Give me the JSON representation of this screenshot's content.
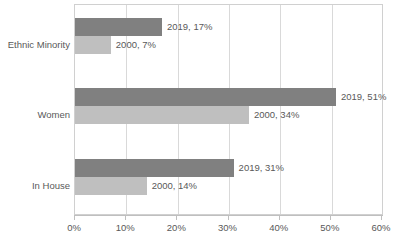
{
  "chart_data": {
    "type": "bar",
    "orientation": "horizontal",
    "title": "",
    "subtitle": "",
    "xlabel": "",
    "ylabel": "",
    "xlim": [
      0,
      60
    ],
    "xticks": [
      "0%",
      "10%",
      "20%",
      "30%",
      "40%",
      "50%",
      "60%"
    ],
    "xtick_values": [
      0,
      10,
      20,
      30,
      40,
      50,
      60
    ],
    "grid": true,
    "legend": false,
    "legend_position": "none",
    "categories": [
      "Ethnic Minority",
      "Women",
      "In House"
    ],
    "series": [
      {
        "name": "2019",
        "color": "#808080",
        "values": [
          17,
          51,
          31
        ],
        "labels": [
          "2019, 17%",
          "2019, 51%",
          "2019, 31%"
        ]
      },
      {
        "name": "2000",
        "color": "#bfbfbf",
        "values": [
          7,
          34,
          14
        ],
        "labels": [
          "2000, 7%",
          "2000, 34%",
          "2000, 14%"
        ]
      }
    ],
    "axis_color": "#bfbfbf",
    "gridline_color": "#d9d9d9",
    "text_color": "#595959",
    "background": "#ffffff"
  }
}
